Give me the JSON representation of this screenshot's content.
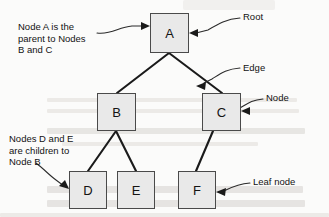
{
  "diagram": {
    "node_fill": "#e9e9e9",
    "node_stroke": "#4a4a4a",
    "edge_color": "#1a1a1a",
    "leader_color": "#2a2a2a",
    "text_color": "#121212"
  },
  "nodes": [
    {
      "id": "a",
      "label": "A",
      "role": "root",
      "x": 150,
      "y": 13,
      "w": 39,
      "h": 40
    },
    {
      "id": "b",
      "label": "B",
      "role": "node",
      "x": 97,
      "y": 93,
      "w": 39,
      "h": 38
    },
    {
      "id": "c",
      "label": "C",
      "role": "node",
      "x": 202,
      "y": 93,
      "w": 39,
      "h": 38
    },
    {
      "id": "d",
      "label": "D",
      "role": "leaf",
      "x": 69,
      "y": 171,
      "w": 38,
      "h": 38
    },
    {
      "id": "e",
      "label": "E",
      "role": "leaf",
      "x": 117,
      "y": 171,
      "w": 38,
      "h": 38
    },
    {
      "id": "f",
      "label": "F",
      "role": "leaf",
      "x": 178,
      "y": 171,
      "w": 38,
      "h": 38
    }
  ],
  "edges": [
    {
      "from": "a",
      "to": "b"
    },
    {
      "from": "a",
      "to": "c"
    },
    {
      "from": "b",
      "to": "d"
    },
    {
      "from": "b",
      "to": "e"
    },
    {
      "from": "c",
      "to": "f"
    }
  ],
  "annotations": {
    "parent_note": {
      "text": "Node A is the\nparent to Nodes\nB and C",
      "x": 18,
      "y": 21,
      "points_to": "a"
    },
    "children_note": {
      "text": "Nodes D and E\nare children to\nNode B",
      "x": 9,
      "y": 133,
      "points_to": "d"
    }
  },
  "labels": {
    "root": {
      "text": "Root",
      "x": 243,
      "y": 11,
      "points_to": "a"
    },
    "edge": {
      "text": "Edge",
      "x": 243,
      "y": 62,
      "points_to": "edge-a-c"
    },
    "node": {
      "text": "Node",
      "x": 266,
      "y": 92,
      "points_to": "c"
    },
    "leaf": {
      "text": "Leaf node",
      "x": 253,
      "y": 176,
      "points_to": "f"
    }
  }
}
